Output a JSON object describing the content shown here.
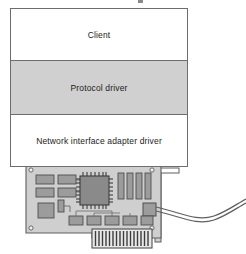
{
  "figure": {
    "name": "network-driver-stack-diagram"
  },
  "stack": {
    "layers": [
      {
        "id": "client",
        "label": "Client",
        "fill": "#ffffff"
      },
      {
        "id": "protocol-driver",
        "label": "Protocol driver",
        "fill": "#d0d0d0"
      },
      {
        "id": "nic-driver",
        "label": "Network interface adapter driver",
        "fill": "#ffffff"
      }
    ]
  },
  "illustration": {
    "name": "network-interface-card",
    "parts": [
      "circuit-board",
      "main-chip",
      "memory-slots",
      "support-chips",
      "edge-connector",
      "mounting-bracket",
      "port-connector",
      "network-cable",
      "mounting-holes"
    ]
  },
  "colors": {
    "outline": "#6d6d6d",
    "layer_highlight": "#d0d0d0",
    "board_fill": "#cfcfcf",
    "component_fill": "#9c9c9c",
    "chip_fill": "#8a8a8a",
    "text": "#1b1b1b",
    "page_background": "#ffffff"
  }
}
